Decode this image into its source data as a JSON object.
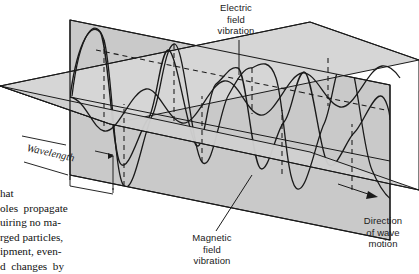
{
  "figure": {
    "type": "physics-schematic-3d",
    "background_color": "#ffffff",
    "stroke_color": "#1a1a1a",
    "plane_fill_vertical": "#c9c9c9",
    "plane_fill_horizontal": "#d6d6d6",
    "plane_fill_horizontal_front": "#cfcfcf"
  },
  "labels": {
    "electric": "Electric\nfield\nvibration",
    "magnetic": "Magnetic\nfield\nvibration",
    "direction": "Direction\nof wave\nmotion",
    "wavelength": "Wavelength"
  },
  "body_text": {
    "lines": [
      "hat",
      "oles  propagate",
      "uiring no ma-",
      "rged particles,",
      "ipment, even-",
      "d  changes  by"
    ]
  },
  "wave_geometry": {
    "cycles": 3.5,
    "electric_plane": "vertical",
    "magnetic_plane": "horizontal",
    "phase_relationship": "in-phase",
    "wavelength_span_px": 86
  }
}
